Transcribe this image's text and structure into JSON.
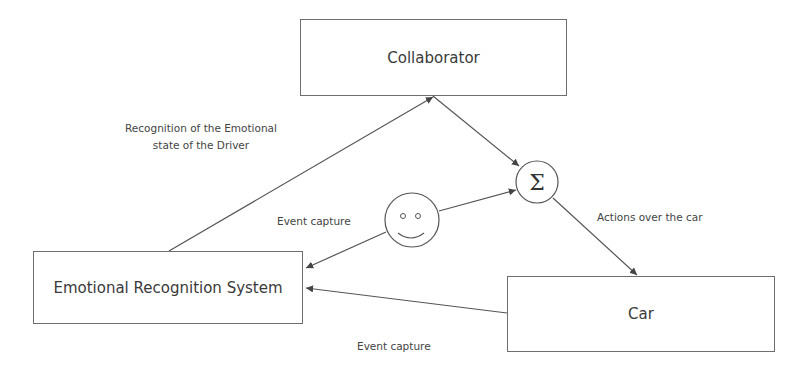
{
  "diagram": {
    "nodes": {
      "collaborator": {
        "label": "Collaborator"
      },
      "ers": {
        "label": "Emotional Recognition System"
      },
      "car": {
        "label": "Car"
      },
      "sum": {
        "label": "Σ",
        "icon": "sigma-summation-icon"
      },
      "driver": {
        "icon": "smiley-face-icon"
      }
    },
    "edges": [
      {
        "from": "ers",
        "to": "collaborator",
        "label": "Recognition of the Emotional state of the Driver"
      },
      {
        "from": "collaborator",
        "to": "sum",
        "label": ""
      },
      {
        "from": "driver",
        "to": "sum",
        "label": ""
      },
      {
        "from": "driver",
        "to": "ers",
        "label": "Event capture"
      },
      {
        "from": "sum",
        "to": "car",
        "label": "Actions over the car"
      },
      {
        "from": "car",
        "to": "ers",
        "label": "Event capture"
      }
    ],
    "labels": {
      "recognition_line1": "Recognition of the Emotional",
      "recognition_line2": "state of the Driver",
      "event_capture_top": "Event capture",
      "actions_over_car": "Actions over the car",
      "event_capture_bottom": "Event capture"
    },
    "colors": {
      "stroke": "#555555",
      "box_border": "#6e6e6e",
      "text": "#3a3a3a",
      "background": "#ffffff"
    }
  }
}
